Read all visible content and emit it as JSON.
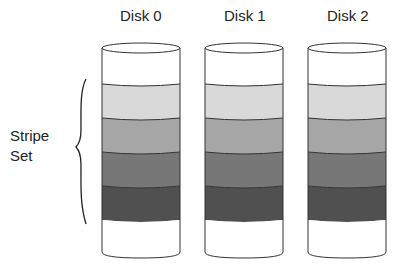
{
  "diagram": {
    "title": "",
    "disks": [
      {
        "label": "Disk 0",
        "x": 102
      },
      {
        "label": "Disk 1",
        "x": 205
      },
      {
        "label": "Disk 2",
        "x": 308
      }
    ],
    "stripe_label_line1": "Stripe",
    "stripe_label_line2": "Set",
    "bands": [
      {
        "name": "empty-top",
        "color": "#ffffff"
      },
      {
        "name": "stripe-1",
        "color": "#d9d9d9"
      },
      {
        "name": "stripe-2",
        "color": "#a6a6a6"
      },
      {
        "name": "stripe-3",
        "color": "#777777"
      },
      {
        "name": "stripe-4",
        "color": "#505050"
      },
      {
        "name": "empty-bottom",
        "color": "#ffffff"
      }
    ],
    "outline_color": "#333333"
  }
}
